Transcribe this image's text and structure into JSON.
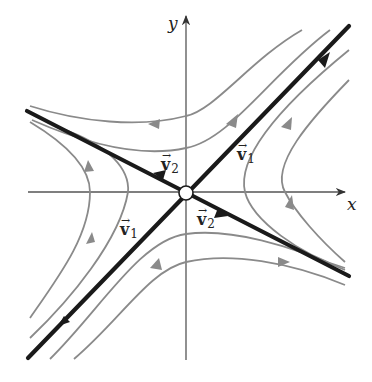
{
  "diagram": {
    "type": "phase-portrait-saddle",
    "axes": {
      "x_label": "x",
      "y_label": "y"
    },
    "origin": {
      "marker": "open-circle",
      "label": "equilibrium"
    },
    "eigenvectors": [
      {
        "name": "v1",
        "label": "v",
        "subscript": "1",
        "direction": "toward-origin",
        "slope": "positive"
      },
      {
        "name": "v2",
        "label": "v",
        "subscript": "2",
        "direction": "away-from-origin",
        "slope": "negative"
      }
    ],
    "labels": {
      "v1_upper": {
        "base": "v",
        "sub": "1"
      },
      "v1_lower": {
        "base": "v",
        "sub": "1"
      },
      "v2_upper": {
        "base": "v",
        "sub": "2"
      },
      "v2_lower": {
        "base": "v",
        "sub": "2"
      },
      "vec_arrow": "→"
    },
    "colors": {
      "eigenline": "#1a1a1a",
      "trajectory": "#8a8a8a",
      "axis": "#555555",
      "background": "#ffffff"
    }
  }
}
